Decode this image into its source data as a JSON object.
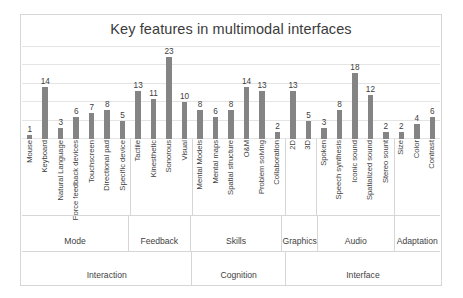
{
  "chart": {
    "title": "Key features in multimodal interfaces"
  },
  "chart_data": {
    "type": "bar",
    "title": "Key features in multimodal interfaces",
    "xlabel": "",
    "ylabel": "",
    "ylim": [
      0,
      25
    ],
    "grid": true,
    "legend": "none",
    "bar_color": "#848484",
    "categories": [
      "Mouse",
      "Keyboard",
      "Natural Language",
      "Force feedback devices",
      "Touchscreen",
      "Directional pad",
      "Specific device",
      "Tactile",
      "Kinesthetic",
      "Sonorous",
      "Visual",
      "Mental Models",
      "Mental maps",
      "Spatial structure",
      "O&M",
      "Problem solving",
      "Collaboration",
      "2D",
      "3D",
      "Spoken",
      "Speech synthesis",
      "Iconic sound",
      "Spatialized sound",
      "Stereo sount",
      "Size",
      "Color",
      "Contrast"
    ],
    "values": [
      1,
      14,
      3,
      6,
      7,
      8,
      5,
      13,
      11,
      23,
      10,
      8,
      6,
      8,
      14,
      13,
      2,
      13,
      5,
      3,
      8,
      18,
      12,
      2,
      2,
      4,
      6
    ],
    "group_level_1": [
      {
        "label": "Mode",
        "span": 7
      },
      {
        "label": "Feedback",
        "span": 4
      },
      {
        "label": "Skills",
        "span": 6
      },
      {
        "label": "Graphics",
        "span": 2
      },
      {
        "label": "Audio",
        "span": 5
      },
      {
        "label": "Adaptation",
        "span": 3
      }
    ],
    "group_level_2": [
      {
        "label": "Interaction",
        "span": 11
      },
      {
        "label": "Cognition",
        "span": 6
      },
      {
        "label": "Interface",
        "span": 10
      }
    ]
  }
}
